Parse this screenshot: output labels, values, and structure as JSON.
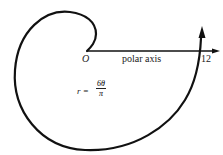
{
  "diagram": {
    "origin_label": "O",
    "axis_label": "polar axis",
    "tick_label": "12",
    "equation": {
      "lhs": "r =",
      "numerator": "6θ",
      "denominator": "π"
    },
    "colors": {
      "stroke": "#111111",
      "text": "#222222",
      "background": "#ffffff"
    }
  }
}
